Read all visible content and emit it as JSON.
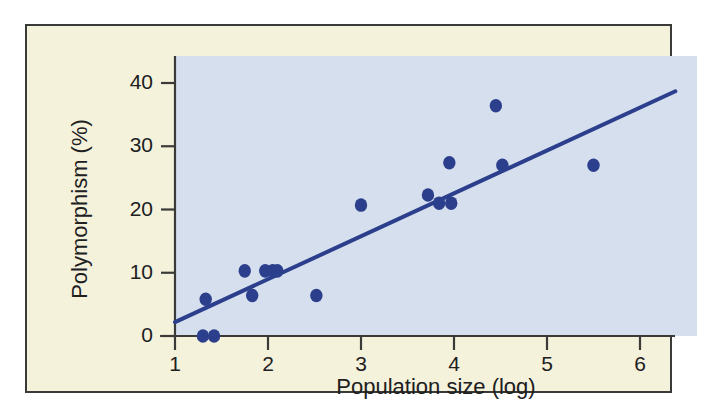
{
  "chart_data": {
    "type": "scatter",
    "title": "",
    "xlabel": "Population size (log)",
    "ylabel": "Polymorphism (%)",
    "xlim": [
      1,
      6
    ],
    "ylim": [
      0,
      43
    ],
    "xticks": [
      1,
      2,
      3,
      4,
      5,
      6
    ],
    "xtick_labels": [
      "1",
      "2",
      "3",
      "4",
      "5",
      "6"
    ],
    "yticks": [
      0,
      10,
      20,
      30,
      40
    ],
    "ytick_labels": [
      "0",
      "10",
      "20",
      "30",
      "40"
    ],
    "grid": false,
    "legend": "none",
    "series": [
      {
        "name": "populations",
        "marker": "filled-circle",
        "color": "#2b3f8c",
        "points": [
          {
            "x": 1.3,
            "y": 0.0
          },
          {
            "x": 1.42,
            "y": 0.0
          },
          {
            "x": 1.33,
            "y": 5.8
          },
          {
            "x": 1.75,
            "y": 10.3
          },
          {
            "x": 1.83,
            "y": 6.4
          },
          {
            "x": 1.97,
            "y": 10.3
          },
          {
            "x": 2.05,
            "y": 10.3
          },
          {
            "x": 2.1,
            "y": 10.3
          },
          {
            "x": 2.52,
            "y": 6.4
          },
          {
            "x": 3.0,
            "y": 20.7
          },
          {
            "x": 3.72,
            "y": 22.3
          },
          {
            "x": 3.84,
            "y": 21.0
          },
          {
            "x": 3.97,
            "y": 21.0
          },
          {
            "x": 3.95,
            "y": 27.4
          },
          {
            "x": 4.45,
            "y": 36.4
          },
          {
            "x": 4.52,
            "y": 27.0
          },
          {
            "x": 5.5,
            "y": 27.0
          }
        ]
      }
    ],
    "trendline": {
      "name": "regression-line",
      "color": "#2b3f8c",
      "x_start": 1.0,
      "y_start": 2.2,
      "x_end": 6.38,
      "y_end": 38.7
    },
    "colors": {
      "plot_background": "#d6dfee",
      "page_background": "#f5f2dc",
      "marker": "#2b3f8c",
      "line": "#2b3f8c",
      "axis": "#3a3a38",
      "text": "#20201e"
    }
  }
}
